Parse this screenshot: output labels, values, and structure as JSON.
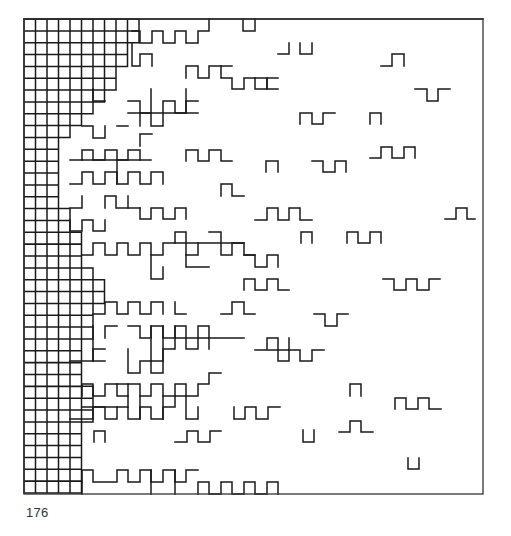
{
  "page": {
    "number": "176"
  },
  "artwork": {
    "description": "Plotter drawing: dense square grid on the left dissolving into scattered meander fragments toward the right",
    "stroke_color": "#1a1a1a",
    "frame": {
      "x": 24,
      "y": 19,
      "width": 459,
      "height": 475
    },
    "grid": {
      "x0": 24,
      "y0": 19,
      "cell_w": 11.5,
      "cell_h": 11.85,
      "cols": 40,
      "rows": 40
    },
    "dense_grid_cols_per_row": [
      10,
      10,
      9,
      9,
      8,
      8,
      7,
      6,
      5,
      4,
      3,
      3,
      3,
      3,
      3,
      3,
      4,
      4,
      5,
      5,
      5,
      6,
      7,
      7,
      6,
      6,
      6,
      5,
      5,
      5,
      5,
      6,
      6,
      6,
      5,
      5,
      5,
      5,
      5,
      5
    ],
    "fragments": [
      "M24,19 L483,19",
      "M132,31 L140,31 L140,43 L152,43 L152,31 L163,31 L163,43 L175,43 L175,31 L186,31 L186,43 L198,43 L198,31 L209,31 L209,19",
      "M243,19 L243,31 L255,31 L255,19",
      "M132,43 L132,66 L140,66 L140,54 L152,54 L152,66",
      "M278,54 L289,54 L289,43",
      "M300,43 L300,54 L312,54 L312,43",
      "M381,66 L392,66 L392,54 L404,54 L404,66",
      "M186,78 L186,66 L198,66 L198,78 L209,78 L209,66 L221,66 L221,78 L232,78 L232,89 L244,89 L244,78 L255,78 L255,89 L267,89 L267,78 L278,78",
      "M232,66 L221,66",
      "M255,78 L267,78 L267,89 L278,89",
      "M415,89 L427,89 L427,101 L438,101 L438,89 L450,89",
      "M93,89 L93,101 L105,101",
      "M151,89 L151,126 L163,126 L163,101 L175,101 L175,113 L186,113 L186,101 L198,101",
      "M128,101 L140,101 L140,113 L151,113",
      "M128,113 L198,113",
      "M186,89 L186,113",
      "M140,113 L140,126",
      "M300,124 L300,113 L312,113 L312,124 L323,124 L323,113 L335,113",
      "M370,124 L370,113 L381,113 L381,124",
      "M82,126 L93,126 L93,138 L105,138 L105,126",
      "M117,126 L128,126",
      "M140,146 L140,134 L152,134",
      "M82,160 L82,150 L93,150 L93,160 L105,160 L105,150 L117,150 L117,160 L128,160 L128,150 L140,150 L140,160",
      "M70,160 L151,160",
      "M186,161 L186,150 L198,150 L198,161 L209,161 L209,150 L221,150 L221,161 L232,161",
      "M266,172 L266,161 L278,161 L278,172",
      "M312,161 L323,161 L323,172 L335,172 L335,161 L346,161 L346,172",
      "M370,158 L381,158 L381,147 L392,147 L392,158 L404,158 L404,147 L415,147 L415,158",
      "M70,184 L82,184 L82,172 L93,172 L93,184 L105,184 L105,172 L117,172 L117,184 L128,184 L128,172 L140,172 L140,184 L151,184 L151,172 L163,172 L163,184",
      "M117,160 L117,184",
      "M221,196 L221,184 L232,184 L232,196 L244,196",
      "M70,208 L82,208 L82,196",
      "M105,208 L105,196 L116,196 L116,208",
      "M128,208 L128,196",
      "M140,208 L140,219 L151,219 L151,208 L163,208 L163,219 L175,219 L175,208 L186,208 L186,219",
      "M117,208 L140,208",
      "M255,220 L267,220 L267,208 L278,208 L278,220 L289,220 L289,208 L300,208 L300,220 L312,220",
      "M445,219 L456,219 L456,208 L467,208 L467,219 L475,219",
      "M70,220 L70,231 L82,231 L82,220 L93,220 L93,231 L105,231 L105,220",
      "M301,243 L301,232 L312,232 L312,243",
      "M347,243 L347,232 L358,232 L358,243 L370,243 L370,232 L381,232 L381,243",
      "M82,255 L93,255 L93,243 L105,243 L105,255 L117,255 L117,243 L128,243 L128,255 L140,255 L140,243 L151,243 L151,255 L163,255 L163,243 L175,243 L175,232 L186,232 L186,255 L198,255 L198,243",
      "M175,243 L244,243",
      "M209,232 L221,232 L221,255 L232,255 L232,243 L244,243 L244,255 L255,255",
      "M244,255 L255,255 L255,267 L267,267 L267,255 L278,255 L278,267",
      "M151,255 L151,279 L163,279 L163,267",
      "M186,255 L186,267 L209,267",
      "M244,290 L244,279 L255,279 L255,290 L267,290 L267,279 L278,279 L278,290 L289,290",
      "M383,279 L394,279 L394,290 L406,290 L406,279 L417,279 L417,290 L429,290 L429,279 L440,279",
      "M93,314 L105,314 L105,302 L117,302 L117,314 L128,314 L128,302 L140,302 L140,314 L151,314 L151,302 L163,302 L163,314",
      "M175,302 L175,314 L186,314",
      "M221,314 L232,314 L232,302 L244,302 L244,314 L255,314",
      "M314,314 L325,314 L325,326 L337,326 L337,314 L348,314",
      "M128,326 L140,326 L140,338 L151,338 L151,326 L163,326 L163,338 L175,338 L175,326 L186,326 L186,338 L198,338 L198,326 L209,326 L209,338 L244,338",
      "M151,326 L151,361 L163,361 L163,326",
      "M175,326 L175,338",
      "M93,326 L93,361",
      "M105,338 L105,326 L117,326",
      "M70,361 L105,361",
      "M128,349 L128,373 L140,373 L140,361 L151,361 L151,373 L163,373 L163,349 L175,349 L175,338 L186,338 L186,349 L198,349 L198,338 L209,338 L209,349",
      "M93,361 L93,349 L105,349",
      "M255,350 L267,350 L267,338 L278,338 L278,350 L289,350 L289,338",
      "M268,350 L278,350 L278,361 L289,361 L289,350 L300,350 L300,361 L312,361 L312,350 L324,350",
      "M117,384 L128,384",
      "M82,396 L82,384 L93,384 L93,396 L105,396 L105,384 L117,384 L117,396 L128,396 L128,384 L140,384 L140,396 L151,396 L151,384 L163,384 L163,396 L175,396 L175,384 L186,384 L186,396 L198,396 L198,384 L209,384 L209,373 L221,373",
      "M350,396 L350,384 L361,384 L361,396",
      "M82,407 L117,407",
      "M128,396 L128,407",
      "M70,419 L93,419 L93,407 L105,407 L105,419 L117,419 L117,407 L128,407 L128,419 L140,419 L140,407 L151,407 L151,419 L163,419 L163,407 L175,407 L175,396 L186,396 L186,419 L198,419 L198,407",
      "M140,396 L140,419",
      "M163,396 L163,419",
      "M234,407 L234,419 L245,419 L245,407 L256,407 L256,419 L268,419 L268,407 L280,407",
      "M395,409 L395,398 L406,398 L406,409 L418,409 L418,398 L429,398 L429,409 L441,409",
      "M94,442 L94,431 L105,431 L105,442",
      "M175,442 L187,442 L187,431 L198,431 L198,442 L210,442 L210,431 L221,431",
      "M339,432 L350,432 L350,421 L361,421 L361,432 L373,432",
      "M303,430 L303,442 L314,442 L314,430",
      "M408,458 L408,469 L419,469 L419,458",
      "M82,482 L82,470 L93,470 L93,482 L117,482 L117,470 L128,470 L128,482 L140,482 L140,470 L151,470 L151,482 L163,482 L163,470 L175,470 L175,482 L186,482 L186,470 L198,470",
      "M151,470 L151,494",
      "M175,470 L175,494",
      "M82,482 L82,494",
      "M198,494 L198,482 L209,482 L209,494 L221,494 L221,482 L232,482 L232,494 L244,494 L244,482 L255,482 L255,494 L267,494 L267,482 L278,482 L278,494"
    ]
  }
}
